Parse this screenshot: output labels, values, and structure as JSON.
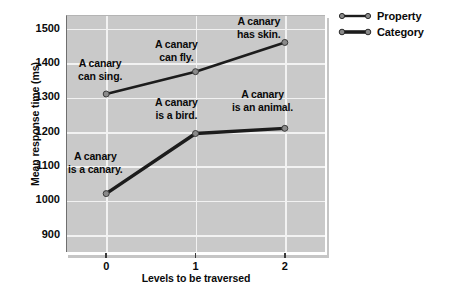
{
  "chart_data": {
    "type": "line",
    "title": "",
    "xlabel": "Levels to be traversed",
    "ylabel": "Mean response time (ms)",
    "x": [
      0,
      1,
      2
    ],
    "xticklabels": [
      "0",
      "1",
      "2"
    ],
    "yticklabels": [
      "900",
      "1000",
      "1100",
      "1200",
      "1300",
      "1400",
      "1500"
    ],
    "yticks": [
      900,
      1000,
      1100,
      1200,
      1300,
      1400,
      1500
    ],
    "ylim": [
      850,
      1540
    ],
    "xlim": [
      -0.45,
      2.45
    ],
    "grid": "both",
    "legend_position": "upper right outside",
    "series": [
      {
        "name": "Property",
        "values": [
          1310,
          1375,
          1460
        ],
        "labels": [
          "A canary\ncan sing.",
          "A canary\ncan fly.",
          "A canary\nhas skin."
        ]
      },
      {
        "name": "Category",
        "values": [
          1020,
          1195,
          1210
        ],
        "labels": [
          "A canary\nis a canary.",
          "A canary\nis a bird.",
          "A canary\nis an animal."
        ]
      }
    ]
  },
  "legend": {
    "items": [
      {
        "label": "Property"
      },
      {
        "label": "Category"
      }
    ]
  },
  "annotations": [
    {
      "text_line1": "A canary",
      "text_line2": "can sing.",
      "left": 78,
      "top": 57
    },
    {
      "text_line1": "A canary",
      "text_line2": "can fly.",
      "left": 155,
      "top": 38
    },
    {
      "text_line1": "A canary",
      "text_line2": "has skin.",
      "left": 237,
      "top": 15
    },
    {
      "text_line1": "A canary",
      "text_line2": "is a canary.",
      "left": 68,
      "top": 150
    },
    {
      "text_line1": "A canary",
      "text_line2": "is a bird.",
      "left": 155,
      "top": 96
    },
    {
      "text_line1": "A canary",
      "text_line2": "is an animal.",
      "left": 232,
      "top": 88
    }
  ],
  "colors": {
    "plot_background": "#c9c9c9",
    "gridline": "#f2f2f2",
    "series_line": "#1c1c1c",
    "marker_fill": "#8a8a8a",
    "text": "#0a0a0a"
  }
}
